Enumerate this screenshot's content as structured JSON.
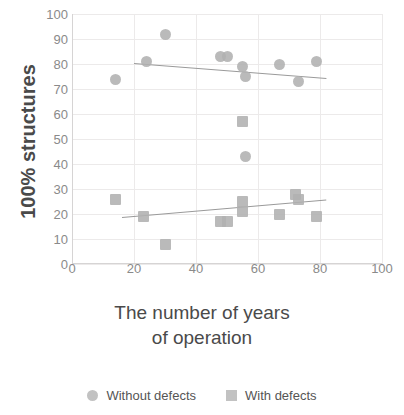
{
  "chart_data": {
    "type": "scatter",
    "title": "",
    "xlabel_line1": "The number of years",
    "xlabel_line2": "of operation",
    "ylabel": "100% structures",
    "xlim": [
      0,
      100
    ],
    "ylim": [
      0,
      100
    ],
    "xticks": [
      0,
      20,
      40,
      60,
      80,
      100
    ],
    "yticks": [
      0,
      10,
      20,
      30,
      40,
      50,
      60,
      70,
      80,
      90,
      100
    ],
    "grid": true,
    "legend_position": "bottom",
    "marker_color": "#b0b0b0",
    "trendline_color": "#9a9a9a",
    "series": [
      {
        "name": "Without defects",
        "marker": "circle",
        "points": [
          {
            "x": 14,
            "y": 74
          },
          {
            "x": 24,
            "y": 81
          },
          {
            "x": 30,
            "y": 92
          },
          {
            "x": 48,
            "y": 83
          },
          {
            "x": 50,
            "y": 83
          },
          {
            "x": 55,
            "y": 79
          },
          {
            "x": 56,
            "y": 75
          },
          {
            "x": 56,
            "y": 43
          },
          {
            "x": 67,
            "y": 80
          },
          {
            "x": 73,
            "y": 73
          },
          {
            "x": 79,
            "y": 81
          }
        ],
        "trendline": {
          "x0": 20,
          "y0": 80.5,
          "x1": 82,
          "y1": 74.5
        }
      },
      {
        "name": "With defects",
        "marker": "square",
        "points": [
          {
            "x": 14,
            "y": 26
          },
          {
            "x": 23,
            "y": 19
          },
          {
            "x": 30,
            "y": 8
          },
          {
            "x": 48,
            "y": 17
          },
          {
            "x": 50,
            "y": 17
          },
          {
            "x": 55,
            "y": 25
          },
          {
            "x": 55,
            "y": 21
          },
          {
            "x": 55,
            "y": 57
          },
          {
            "x": 67,
            "y": 20
          },
          {
            "x": 72,
            "y": 28
          },
          {
            "x": 73,
            "y": 26
          },
          {
            "x": 79,
            "y": 19
          }
        ],
        "trendline": {
          "x0": 16,
          "y0": 19,
          "x1": 82,
          "y1": 26
        }
      }
    ]
  },
  "legend": {
    "entries": [
      {
        "label": "Without defects",
        "marker": "circle"
      },
      {
        "label": "With defects",
        "marker": "square"
      }
    ]
  }
}
